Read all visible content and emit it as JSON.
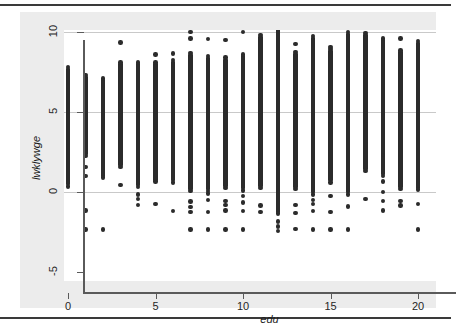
{
  "figure": {
    "background_color": "#ececec",
    "plot_background_color": "#ffffff",
    "rule_color": "#3a3a3a",
    "axis_color": "#5a5a5a",
    "grid_color": "#c9c9c9",
    "marker_color": "#2b2b2b"
  },
  "chart_data": {
    "type": "scatter",
    "title": "",
    "xlabel": "edu",
    "ylabel": "lwklywge",
    "xlim": [
      -0.7,
      20.9
    ],
    "ylim": [
      -5.6,
      11.2
    ],
    "xticks": [
      0,
      5,
      10,
      15,
      20
    ],
    "xticklabels": [
      "0",
      "5",
      "10",
      "15",
      "20"
    ],
    "yticks": [
      -5,
      0,
      5,
      10
    ],
    "yticklabels": [
      "-5",
      "0",
      "5",
      "10"
    ],
    "grid": "horizontal",
    "legend": "none",
    "marker": "filled-circle",
    "columns": [
      {
        "x": 0,
        "dense_min": 0.35,
        "dense_max": 7.8,
        "outliers": []
      },
      {
        "x": 1,
        "dense_min": 2.25,
        "dense_max": 7.3,
        "outliers": [
          1.55,
          1.0,
          -1.15,
          -2.35
        ]
      },
      {
        "x": 2,
        "dense_min": 0.9,
        "dense_max": 7.1,
        "outliers": [
          -2.35
        ]
      },
      {
        "x": 3,
        "dense_min": 1.55,
        "dense_max": 8.1,
        "outliers": [
          9.35,
          0.45
        ]
      },
      {
        "x": 4,
        "dense_min": 0.3,
        "dense_max": 8.1,
        "outliers": [
          -0.15,
          -0.45,
          -0.8
        ]
      },
      {
        "x": 5,
        "dense_min": 0.65,
        "dense_max": 8.1,
        "outliers": [
          8.6,
          -0.75
        ]
      },
      {
        "x": 6,
        "dense_min": 0.6,
        "dense_max": 8.25,
        "outliers": [
          8.65,
          -1.2
        ]
      },
      {
        "x": 7,
        "dense_min": 0.05,
        "dense_max": 8.7,
        "outliers": [
          10.0,
          9.6,
          -0.6,
          -0.95,
          -1.25,
          -2.35
        ]
      },
      {
        "x": 8,
        "dense_min": 0.05,
        "dense_max": 8.5,
        "outliers": [
          9.55,
          -0.1,
          -0.5,
          -1.25,
          -2.35
        ]
      },
      {
        "x": 9,
        "dense_min": 0.25,
        "dense_max": 8.4,
        "outliers": [
          9.5,
          -0.55,
          -0.8,
          -1.15,
          -2.35
        ]
      },
      {
        "x": 10,
        "dense_min": 0.1,
        "dense_max": 8.6,
        "outliers": [
          10.0,
          -0.25,
          -0.65,
          -1.2,
          -2.35
        ]
      },
      {
        "x": 11,
        "dense_min": 0.25,
        "dense_max": 9.8,
        "outliers": [
          -0.85,
          -1.25
        ]
      },
      {
        "x": 12,
        "dense_min": -1.35,
        "dense_max": 10.25,
        "outliers": [
          -1.85,
          -2.15,
          -2.45
        ]
      },
      {
        "x": 13,
        "dense_min": 0.2,
        "dense_max": 8.75,
        "outliers": [
          9.25,
          -0.8,
          -1.3,
          -2.3
        ]
      },
      {
        "x": 14,
        "dense_min": -0.15,
        "dense_max": 9.75,
        "outliers": [
          -0.5,
          -0.75,
          -1.2,
          -2.35
        ]
      },
      {
        "x": 15,
        "dense_min": 0.6,
        "dense_max": 8.95,
        "outliers": [
          10.5,
          9.05,
          -0.25,
          -1.25,
          -2.35
        ]
      },
      {
        "x": 16,
        "dense_min": -0.15,
        "dense_max": 10.0,
        "outliers": [
          10.5,
          -0.9,
          -2.35
        ]
      },
      {
        "x": 17,
        "dense_min": 1.3,
        "dense_max": 9.95,
        "outliers": [
          -0.45
        ]
      },
      {
        "x": 18,
        "dense_min": 1.0,
        "dense_max": 9.6,
        "outliers": [
          2.3,
          0.65,
          0.0,
          -0.55,
          -1.15
        ]
      },
      {
        "x": 19,
        "dense_min": 0.2,
        "dense_max": 8.85,
        "outliers": [
          9.6,
          -0.55,
          -0.85
        ]
      },
      {
        "x": 20,
        "dense_min": 0.15,
        "dense_max": 9.45,
        "outliers": [
          10.45,
          -0.75,
          -2.35
        ]
      }
    ]
  }
}
